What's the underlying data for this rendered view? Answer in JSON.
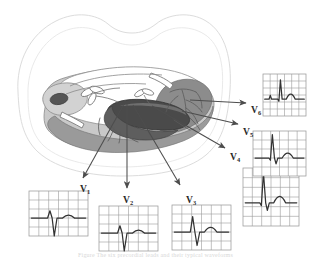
{
  "figure": {
    "caption": "Figure  The six precordial leads and their typical waveforms",
    "colors": {
      "chest_outline": "#d9d9d9",
      "lung_field": "#ffffff",
      "pericardium_light": "#c9c9c9",
      "myocardium_mid": "#9a9a9a",
      "ventricle_cavity_dark": "#6b6b6b",
      "septum_darkest": "#4a4a4a",
      "arrow": "#4d4d4d",
      "grid_line": "#9a9a9a",
      "ecg_trace": "#333333",
      "label_text": "#2b2b2b"
    }
  },
  "anatomy": {
    "chest_wall": {
      "name": "chest-wall-outline",
      "note": "transverse thoracic section silhouette"
    },
    "heart": {
      "name": "heart-cross-section",
      "note": "horizontal section through ventricles"
    },
    "structures": [
      {
        "name": "right-ventricle",
        "label": ""
      },
      {
        "name": "left-ventricle",
        "label": ""
      },
      {
        "name": "interventricular-septum",
        "label": ""
      },
      {
        "name": "coronary-vessels",
        "label": ""
      },
      {
        "name": "mitral-valve-leaflets",
        "label": ""
      },
      {
        "name": "aorta-cavity",
        "label": ""
      }
    ]
  },
  "leads": [
    {
      "id": "V1",
      "letter": "V",
      "subscript": "1",
      "label_x": 80,
      "label_y": 185,
      "arrow": {
        "x1": 124,
        "y1": 104,
        "x2": 83,
        "y2": 178
      },
      "grid": {
        "x": 29,
        "y": 191,
        "w": 59,
        "h": 45,
        "cols": 6,
        "rows": 5
      },
      "morphology": "rS",
      "trace": "small r, deep S, small upright T"
    },
    {
      "id": "V2",
      "letter": "V",
      "subscript": "2",
      "label_x": 123,
      "label_y": 196,
      "arrow": {
        "x1": 127,
        "y1": 104,
        "x2": 127,
        "y2": 188
      },
      "grid": {
        "x": 99,
        "y": 206,
        "w": 59,
        "h": 45,
        "cols": 6,
        "rows": 5
      },
      "morphology": "rS",
      "trace": "small r, deep S, taller T"
    },
    {
      "id": "V3",
      "letter": "V",
      "subscript": "3",
      "label_x": 186,
      "label_y": 196,
      "arrow": {
        "x1": 133,
        "y1": 105,
        "x2": 180,
        "y2": 185
      },
      "grid": {
        "x": 172,
        "y": 205,
        "w": 59,
        "h": 45,
        "cols": 6,
        "rows": 5
      },
      "morphology": "RS",
      "trace": "R equals S transition, upright T"
    },
    {
      "id": "V4",
      "letter": "V",
      "subscript": "4",
      "label_x": 230,
      "label_y": 153,
      "arrow": {
        "x1": 152,
        "y1": 106,
        "x2": 225,
        "y2": 148
      },
      "grid": {
        "x": 243,
        "y": 168,
        "w": 56,
        "h": 58,
        "cols": 6,
        "rows": 6
      },
      "morphology": "qRs",
      "trace": "tall R, small s, upright T"
    },
    {
      "id": "V5",
      "letter": "V",
      "subscript": "5",
      "label_x": 243,
      "label_y": 128,
      "arrow": {
        "x1": 182,
        "y1": 111,
        "x2": 238,
        "y2": 124
      },
      "grid": {
        "x": 253,
        "y": 131,
        "w": 53,
        "h": 45,
        "cols": 6,
        "rows": 5
      },
      "morphology": "qRs",
      "trace": "tall R, small s, upright T"
    },
    {
      "id": "V6",
      "letter": "V",
      "subscript": "6",
      "label_x": 251,
      "label_y": 106,
      "arrow": {
        "x1": 190,
        "y1": 100,
        "x2": 246,
        "y2": 103
      },
      "grid": {
        "x": 263,
        "y": 74,
        "w": 43,
        "h": 42,
        "cols": 6,
        "rows": 6
      },
      "morphology": "qR",
      "trace": "small q, R wave, rounded T"
    }
  ]
}
